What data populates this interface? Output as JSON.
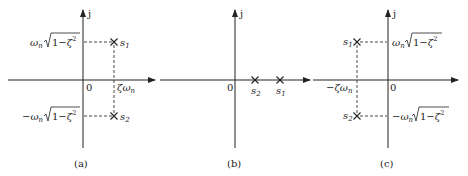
{
  "figure": {
    "panels": [
      {
        "id": "a",
        "caption": "(a)",
        "axis_label_imag": "j",
        "origin_label": "0",
        "real_label": "ζω_n",
        "upper_label": "ω_n√(1−ζ²)",
        "lower_label": "−ω_n√(1−ζ²)",
        "poles": [
          {
            "name": "s1",
            "label": "s",
            "sub": "1",
            "position": "upper-right"
          },
          {
            "name": "s2",
            "label": "s",
            "sub": "2",
            "position": "lower-right"
          }
        ]
      },
      {
        "id": "b",
        "caption": "(b)",
        "axis_label_imag": "j",
        "origin_label": "0",
        "poles": [
          {
            "name": "s2",
            "label": "s",
            "sub": "2",
            "position": "real-axis-near"
          },
          {
            "name": "s1",
            "label": "s",
            "sub": "1",
            "position": "real-axis-far"
          }
        ]
      },
      {
        "id": "c",
        "caption": "(c)",
        "axis_label_imag": "j",
        "origin_label": "0",
        "real_label": "−ζω_n",
        "upper_label": "ω_n√(1−ζ²)",
        "lower_label": "−ω_n√(1−ζ²)",
        "poles": [
          {
            "name": "s1",
            "label": "s",
            "sub": "1",
            "position": "upper-left"
          },
          {
            "name": "s2",
            "label": "s",
            "sub": "2",
            "position": "lower-left"
          }
        ]
      }
    ],
    "text": {
      "j": "j",
      "zero": "0",
      "omega": "ω",
      "n": "n",
      "zeta": "ζ",
      "one_minus": "1−",
      "two": "2",
      "minus": "−",
      "s": "s",
      "one": "1",
      "cap_a": "(a)",
      "cap_b": "(b)",
      "cap_c": "(c)"
    }
  }
}
